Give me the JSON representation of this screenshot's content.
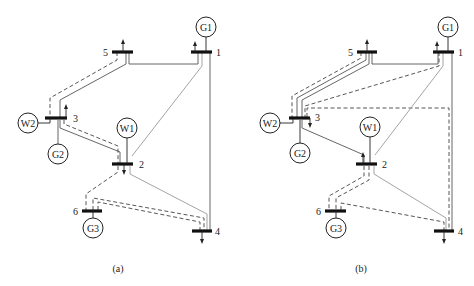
{
  "figure": {
    "panels": [
      {
        "id": "a",
        "caption": "(a)",
        "buses": [
          {
            "id": "1",
            "label": "1"
          },
          {
            "id": "2",
            "label": "2"
          },
          {
            "id": "3",
            "label": "3"
          },
          {
            "id": "4",
            "label": "4"
          },
          {
            "id": "5",
            "label": "5"
          },
          {
            "id": "6",
            "label": "6"
          }
        ],
        "generators": [
          {
            "id": "G1",
            "label": "G1",
            "bus": "1"
          },
          {
            "id": "G2",
            "label": "G2",
            "bus": "3"
          },
          {
            "id": "G3",
            "label": "G3",
            "bus": "6"
          },
          {
            "id": "W1",
            "label": "W1",
            "bus": "2"
          },
          {
            "id": "W2",
            "label": "W2",
            "bus": "3"
          }
        ],
        "loads": [
          {
            "bus": "5",
            "direction": "up"
          },
          {
            "bus": "1",
            "direction": "up"
          },
          {
            "bus": "3",
            "direction": "up"
          },
          {
            "bus": "2",
            "direction": "down"
          },
          {
            "bus": "4",
            "direction": "down"
          }
        ]
      },
      {
        "id": "b",
        "caption": "(b)",
        "buses": [
          {
            "id": "1",
            "label": "1"
          },
          {
            "id": "2",
            "label": "2"
          },
          {
            "id": "3",
            "label": "3"
          },
          {
            "id": "4",
            "label": "4"
          },
          {
            "id": "5",
            "label": "5"
          },
          {
            "id": "6",
            "label": "6"
          }
        ],
        "generators": [
          {
            "id": "G1",
            "label": "G1",
            "bus": "1"
          },
          {
            "id": "G2",
            "label": "G2",
            "bus": "3"
          },
          {
            "id": "G3",
            "label": "G3",
            "bus": "6"
          },
          {
            "id": "W1",
            "label": "W1",
            "bus": "2"
          },
          {
            "id": "W2",
            "label": "W2",
            "bus": "3"
          }
        ],
        "loads": [
          {
            "bus": "5",
            "direction": "up"
          },
          {
            "bus": "1",
            "direction": "up"
          },
          {
            "bus": "3",
            "direction": "down"
          },
          {
            "bus": "2",
            "direction": "up"
          },
          {
            "bus": "4",
            "direction": "down"
          }
        ]
      }
    ]
  }
}
